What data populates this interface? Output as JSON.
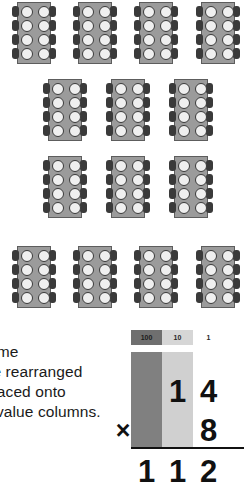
{
  "manipulatives": {
    "description_label": "eight-stud blocks arranged in rows",
    "stud_count_per_block": 8,
    "rows": [
      {
        "count": 4,
        "x_positions": [
          12,
          73,
          134,
          196
        ],
        "y": 2
      },
      {
        "count": 3,
        "x_positions": [
          43,
          106,
          169
        ],
        "y": 79
      },
      {
        "count": 3,
        "x_positions": [
          43,
          106,
          169
        ],
        "y": 156
      },
      {
        "count": 4,
        "x_positions": [
          12,
          73,
          134,
          196
        ],
        "y": 246
      }
    ],
    "total_blocks": 14
  },
  "caption": {
    "lines": [
      "the same",
      "can be rearranged",
      "and placed onto",
      "place value columns."
    ]
  },
  "place_value_table": {
    "headers": [
      "100",
      "10",
      "1"
    ],
    "column_colors": [
      "#808080",
      "#d0d0d0",
      "#ffffff"
    ],
    "header_colors": [
      "#6f6f6f",
      "#d6d6d6",
      "#ffffff"
    ],
    "operator": "×",
    "multiplicand": {
      "hundreds": "",
      "tens": "1",
      "ones": "4"
    },
    "multiplier": {
      "hundreds": "",
      "tens": "",
      "ones": "8"
    },
    "product": {
      "hundreds": "1",
      "tens": "1",
      "ones": "2"
    }
  },
  "colors": {
    "brick_face": "#9b9b9b",
    "brick_outline": "#5d5d5d",
    "stud_fill": "#efefef",
    "stud_outline": "#3a3a3a",
    "text": "#1a1a1a"
  }
}
